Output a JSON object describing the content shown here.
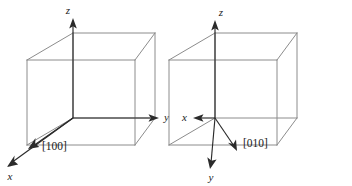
{
  "figure": {
    "background_color": "#ffffff",
    "cube_edge_color": "#8c8c8c",
    "axis_color": "#2b2b2b",
    "label_color": "#1a1a1a",
    "panels": [
      {
        "id": "left",
        "direction_label": "[100]",
        "axes": [
          {
            "name": "z",
            "label": "z",
            "orientation": "up"
          },
          {
            "name": "y",
            "label": "y",
            "orientation": "right"
          },
          {
            "name": "x",
            "label": "x",
            "orientation": "down-left"
          }
        ]
      },
      {
        "id": "right",
        "direction_label": "[010]",
        "axes": [
          {
            "name": "z",
            "label": "z",
            "orientation": "up"
          },
          {
            "name": "x",
            "label": "x",
            "orientation": "left"
          },
          {
            "name": "y",
            "label": "y",
            "orientation": "down-left"
          }
        ]
      }
    ]
  }
}
